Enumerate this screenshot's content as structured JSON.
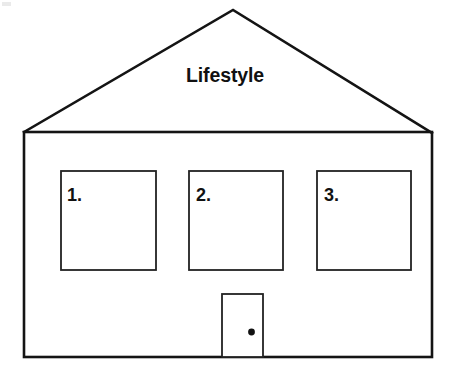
{
  "diagram": {
    "type": "house-outline-worksheet",
    "title": "Lifestyle",
    "gable_label": "Lifestyle",
    "stroke_color": "#141414",
    "fill_color": "#ffffff",
    "background_color": "#ffffff",
    "canvas": {
      "width": 450,
      "height": 374
    },
    "roof": {
      "apex": {
        "x": 233,
        "y": 10
      },
      "left_eave": {
        "x": 24,
        "y": 132
      },
      "right_eave": {
        "x": 432,
        "y": 133
      },
      "stroke_width": 2.6
    },
    "body": {
      "left": 24,
      "top": 132,
      "right": 432,
      "bottom": 357,
      "stroke_width": 2.6
    },
    "windows": [
      {
        "label": "1.",
        "left": 61,
        "top": 171,
        "right": 156,
        "bottom": 270,
        "stroke_width": 1.8
      },
      {
        "label": "2.",
        "left": 189,
        "top": 171,
        "right": 283,
        "bottom": 270,
        "stroke_width": 1.8
      },
      {
        "label": "3.",
        "left": 317,
        "top": 171,
        "right": 411,
        "bottom": 270,
        "stroke_width": 1.8
      }
    ],
    "door": {
      "left": 222,
      "top": 294,
      "right": 263,
      "bottom": 357,
      "stroke_width": 1.8,
      "knob": {
        "cx": 251.5,
        "cy": 332,
        "r": 3.4,
        "color": "#111111"
      }
    }
  }
}
